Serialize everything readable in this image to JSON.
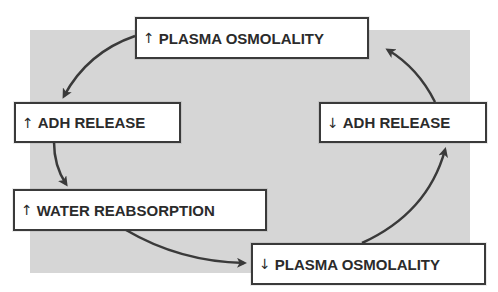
{
  "diagram": {
    "type": "feedback-loop",
    "background_color": "#d6d6d6",
    "box_border_color": "#3a3a3a",
    "arrow_color": "#3a3a3a",
    "nodes": [
      {
        "id": "inc-plasma-osm",
        "symbol": "↑",
        "direction": "increase",
        "label": "PLASMA OSMOLALITY"
      },
      {
        "id": "inc-adh",
        "symbol": "↑",
        "direction": "increase",
        "label": "ADH RELEASE"
      },
      {
        "id": "inc-water",
        "symbol": "↑",
        "direction": "increase",
        "label": "WATER REABSORPTION"
      },
      {
        "id": "dec-plasma-osm",
        "symbol": "↓",
        "direction": "decrease",
        "label": "PLASMA OSMOLALITY"
      },
      {
        "id": "dec-adh",
        "symbol": "↓",
        "direction": "decrease",
        "label": "ADH RELEASE"
      }
    ],
    "edges": [
      {
        "from": "inc-plasma-osm",
        "to": "inc-adh"
      },
      {
        "from": "inc-adh",
        "to": "inc-water"
      },
      {
        "from": "inc-water",
        "to": "dec-plasma-osm"
      },
      {
        "from": "dec-plasma-osm",
        "to": "dec-adh"
      },
      {
        "from": "dec-adh",
        "to": "inc-plasma-osm"
      }
    ]
  }
}
